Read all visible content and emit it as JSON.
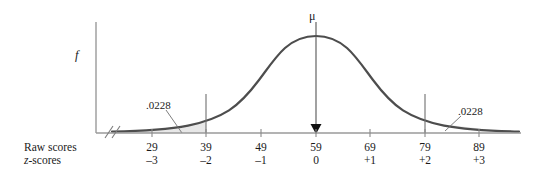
{
  "chart_data": {
    "type": "area",
    "title": "",
    "subtitle": "",
    "xlabel": "",
    "ylabel": "f",
    "distribution": "normal",
    "mean_raw": 59,
    "mean_z": 0,
    "sd_raw": 10,
    "grid": false,
    "legend": false,
    "axis_break": true,
    "x_axis_rows": [
      {
        "name": "Raw scores",
        "italic_prefix": "",
        "values": [
          "29",
          "39",
          "49",
          "59",
          "69",
          "79",
          "89"
        ]
      },
      {
        "name": "z-scores",
        "italic_prefix": "z",
        "values": [
          "–3",
          "–2",
          "–1",
          "0",
          "+1",
          "+2",
          "+3"
        ]
      }
    ],
    "ticks": [
      {
        "raw": "29",
        "z": "–3",
        "x": 152
      },
      {
        "raw": "39",
        "z": "–2",
        "x": 206
      },
      {
        "raw": "49",
        "z": "–1",
        "x": 261
      },
      {
        "raw": "59",
        "z": "0",
        "x": 316
      },
      {
        "raw": "69",
        "z": "+1",
        "x": 370
      },
      {
        "raw": "79",
        "z": "+2",
        "x": 425
      },
      {
        "raw": "89",
        "z": "+3",
        "x": 479
      }
    ],
    "annotations": [
      {
        "name": "left-tail-area",
        "text": ".0228",
        "region": "z < -2",
        "value": 0.0228
      },
      {
        "name": "right-tail-area",
        "text": ".0228",
        "region": "z > +2",
        "value": 0.0228
      },
      {
        "name": "mean-marker",
        "text": "μ",
        "at_z": 0,
        "at_raw": 59
      }
    ],
    "shaded_regions": [
      {
        "name": "left-tail",
        "from_z": -3.6,
        "to_z": -2,
        "probability": 0.0228
      },
      {
        "name": "right-tail",
        "from_z": 2,
        "to_z": 3.6,
        "probability": 0.0228
      }
    ],
    "colors": {
      "curve": "#4d4d4d",
      "shade_fill": "#e7e7e7",
      "axis": "#9a9a9a",
      "text": "#1a1a1a",
      "boundary_line": "#6f6f6f"
    }
  },
  "labels": {
    "raw_scores": "Raw scores",
    "z_scores_prefix": "z",
    "z_scores_rest": "-scores",
    "mu": "μ",
    "f": "f",
    "prob_left": ".0228",
    "prob_right": ".0228"
  }
}
